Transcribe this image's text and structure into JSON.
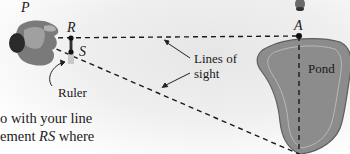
{
  "figure": {
    "labels": {
      "P": "P",
      "R": "R",
      "S": "S",
      "A": "A",
      "lines_of_sight_1": "Lines of",
      "lines_of_sight_2": "sight",
      "ruler": "Ruler",
      "pond": "Pond"
    },
    "body_text": {
      "line1": "o with your line",
      "line2_prefix": "ement ",
      "line2_italic": "RS",
      "line2_suffix": " where"
    },
    "colors": {
      "pond_fill": "#8c8c8c",
      "pond_outline": "#5e5e5e",
      "pond_inner_ring": "#b9b9b9",
      "dashed_line": "#1a1a1a",
      "person": "#6e6e6e",
      "head": "#2a2a2a"
    }
  }
}
